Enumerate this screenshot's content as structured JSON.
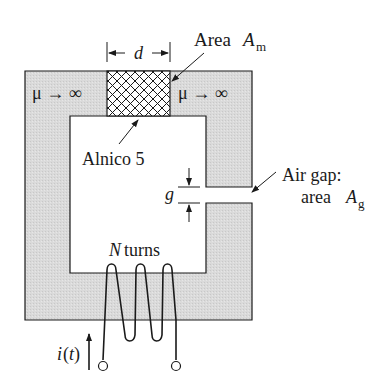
{
  "diagram": {
    "type": "magnetic-circuit",
    "labels": {
      "dimension_d": "d",
      "area_m_prefix": "Area",
      "area_m_symbol": "A",
      "area_m_sub": "m",
      "mu_left": "μ → ∞",
      "mu_right": "μ → ∞",
      "alnico": "Alnico 5",
      "gap_symbol": "g",
      "air_gap_line1": "Air gap:",
      "air_gap_line2_prefix": "area",
      "air_gap_symbol": "A",
      "air_gap_sub": "g",
      "coil_N": "N",
      "coil_turns": "turns",
      "current_i": "i",
      "current_t": "(t)"
    },
    "colors": {
      "core_fill": "#d8d8d8",
      "stroke": "#1a1a1a",
      "background": "#ffffff"
    }
  }
}
